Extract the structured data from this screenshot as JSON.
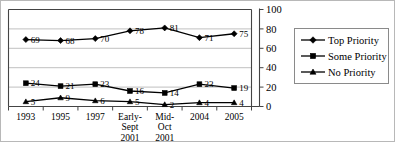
{
  "chart_data": {
    "type": "line",
    "title": "",
    "xlabel": "",
    "ylabel": "",
    "ylim": [
      0,
      100
    ],
    "yticks": [
      0,
      20,
      40,
      60,
      80,
      100
    ],
    "grid": true,
    "legend_position": "right",
    "categories": [
      "1993",
      "1995",
      "1997",
      "Early-\nSept\n2001",
      "Mid-\nOct\n2001",
      "2004",
      "2005"
    ],
    "series": [
      {
        "name": "Top Priority",
        "marker": "diamond",
        "values": [
          69,
          68,
          70,
          78,
          81,
          71,
          75
        ]
      },
      {
        "name": "Some Priority",
        "marker": "square",
        "values": [
          24,
          21,
          23,
          16,
          14,
          23,
          19
        ]
      },
      {
        "name": "No Priority",
        "marker": "triangle",
        "values": [
          5,
          9,
          6,
          5,
          2,
          4,
          4
        ]
      }
    ]
  },
  "legend": {
    "items": [
      {
        "label": "Top Priority",
        "marker": "diamond"
      },
      {
        "label": "Some Priority",
        "marker": "square"
      },
      {
        "label": "No Priority",
        "marker": "triangle"
      }
    ]
  },
  "colors": {
    "series": "#000000",
    "grid": "#b0b0b0",
    "axis": "#444444",
    "background": "#ffffff"
  }
}
